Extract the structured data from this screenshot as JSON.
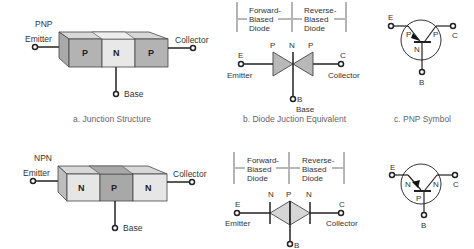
{
  "top": {
    "junction": {
      "type_label": "PNP",
      "emitter": "Emitter",
      "collector": "Collector",
      "base": "Base",
      "regions": [
        "P",
        "N",
        "P"
      ],
      "caption": "a. Junction Structure"
    },
    "diode": {
      "left_bracket": [
        "Forward-",
        "Biased",
        "Diode"
      ],
      "right_bracket": [
        "Reverse-",
        "Biased",
        "Diode"
      ],
      "regions": [
        "P",
        "N",
        "P"
      ],
      "e": "E",
      "c": "C",
      "b": "B",
      "emitter": "Emitter",
      "collector": "Collector",
      "base": "Base",
      "caption": "b. Diode Juction Equivalent"
    },
    "symbol": {
      "e": "E",
      "c": "C",
      "b": "B",
      "left": "P",
      "right": "P",
      "mid": "N",
      "caption": "c. PNP Symbol"
    }
  },
  "bottom": {
    "junction": {
      "type_label": "NPN",
      "emitter": "Emitter",
      "collector": "Collector",
      "base": "Base",
      "regions": [
        "N",
        "P",
        "N"
      ]
    },
    "diode": {
      "left_bracket": [
        "Forward-",
        "Biased",
        "Diode"
      ],
      "right_bracket": [
        "Reverse-",
        "Biased",
        "Diode"
      ],
      "regions": [
        "N",
        "P",
        "N"
      ],
      "e": "E",
      "c": "C",
      "b": "B",
      "emitter": "Emitter",
      "collector": "Collector"
    },
    "symbol": {
      "e": "E",
      "c": "C",
      "b": "B",
      "left": "N",
      "right": "N",
      "mid": "P"
    }
  }
}
